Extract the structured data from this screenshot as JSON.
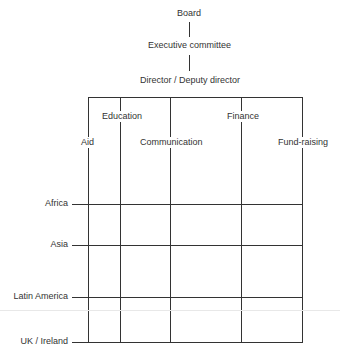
{
  "hierarchy": {
    "board": "Board",
    "executive_committee": "Executive committee",
    "director": "Director / Deputy director"
  },
  "departments": [
    {
      "label": "Aid"
    },
    {
      "label": "Education"
    },
    {
      "label": "Communication"
    },
    {
      "label": "Finance"
    },
    {
      "label": "Fund-raising"
    }
  ],
  "regions": [
    {
      "label": "Africa"
    },
    {
      "label": "Asia"
    },
    {
      "label": "Latin America"
    },
    {
      "label": "UK / Ireland"
    }
  ],
  "colors": {
    "line": "#333333",
    "text": "#333333",
    "background": "#ffffff"
  }
}
